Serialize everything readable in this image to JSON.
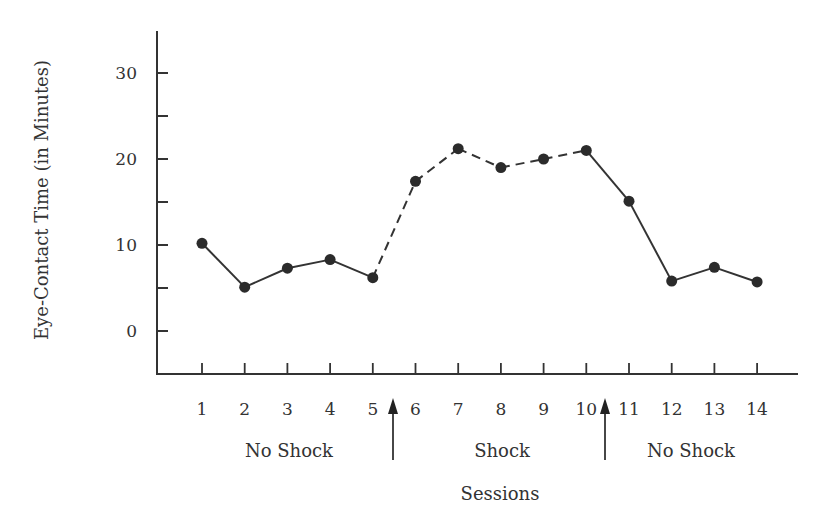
{
  "chart_data": {
    "type": "line",
    "title": "",
    "xlabel": "Sessions",
    "ylabel": "Eye-Contact Time (in Minutes)",
    "x": [
      1,
      2,
      3,
      4,
      5,
      6,
      7,
      8,
      9,
      10,
      11,
      12,
      13,
      14
    ],
    "categories": [
      "1",
      "2",
      "3",
      "4",
      "5",
      "6",
      "7",
      "8",
      "9",
      "10",
      "11",
      "12",
      "13",
      "14"
    ],
    "series": [
      {
        "name": "Eye-contact time",
        "values": [
          10.2,
          5.1,
          7.3,
          8.3,
          6.2,
          17.4,
          21.2,
          19.0,
          20.0,
          21.0,
          15.1,
          5.8,
          7.4,
          5.7
        ],
        "marker": "filled-circle",
        "color": "#333333"
      }
    ],
    "segment_styles": [
      "solid",
      "solid",
      "solid",
      "solid",
      "dashed",
      "dashed",
      "dashed",
      "dashed",
      "dashed",
      "solid",
      "solid",
      "solid",
      "solid"
    ],
    "ylim": [
      -5,
      35
    ],
    "yticks_major": [
      0,
      10,
      20,
      30
    ],
    "yticks_minor": [
      5,
      15,
      25
    ],
    "xlim": [
      0.5,
      14.9
    ],
    "grid": false,
    "legend": null,
    "phases": [
      {
        "label": "No Shock",
        "sessions": [
          1,
          5
        ]
      },
      {
        "label": "Shock",
        "sessions": [
          6,
          10
        ]
      },
      {
        "label": "No Shock",
        "sessions": [
          11,
          14
        ]
      }
    ],
    "annotations": [
      {
        "type": "arrow-up",
        "between_sessions": [
          5,
          6
        ],
        "meaning": "phase change"
      },
      {
        "type": "arrow-up",
        "between_sessions": [
          10,
          11
        ],
        "meaning": "phase change"
      }
    ]
  },
  "labels": {
    "ylabel": "Eye-Contact Time (in Minutes)",
    "xlabel": "Sessions",
    "yticks": [
      "0",
      "10",
      "20",
      "30"
    ],
    "xticks": [
      "1",
      "2",
      "3",
      "4",
      "5",
      "6",
      "7",
      "8",
      "9",
      "10",
      "11",
      "12",
      "13",
      "14"
    ],
    "phases": [
      "No Shock",
      "Shock",
      "No Shock"
    ]
  }
}
